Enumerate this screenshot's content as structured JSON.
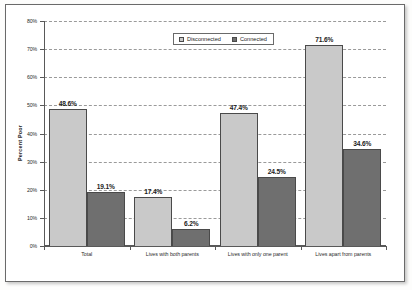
{
  "figure": {
    "frame_border_color": "#6a6a6a",
    "background": "#ffffff"
  },
  "legend": {
    "position": "top-center",
    "entries": [
      {
        "label": "Disconnected",
        "color": "#c9c9c9",
        "swatch_name": "legend-swatch-disconnected"
      },
      {
        "label": "Connected",
        "color": "#6f6f6f",
        "swatch_name": "legend-swatch-connected"
      }
    ]
  },
  "axes": {
    "ylabel": "Percent Poor",
    "yticks": [
      "80%",
      "70%",
      "60%",
      "50%",
      "40%",
      "30%",
      "20%",
      "10%",
      "0%"
    ],
    "ymin": 0,
    "ymax": 80
  },
  "chart_data": {
    "type": "bar",
    "title": "",
    "subtitle": "",
    "xlabel": "",
    "ylabel": "Percent Poor",
    "ylim": [
      0,
      80
    ],
    "ytick_values": [
      0,
      10,
      20,
      30,
      40,
      50,
      60,
      70,
      80
    ],
    "ytick_labels": [
      "0%",
      "10%",
      "20%",
      "30%",
      "40%",
      "50%",
      "60%",
      "70%",
      "80%"
    ],
    "grid": true,
    "grid_style": "dashed-horizontal",
    "legend_position": "top-center",
    "categories": [
      "Total",
      "Lives with both parents",
      "Lives with only one parent",
      "Lives apart from parents"
    ],
    "series": [
      {
        "name": "Disconnected",
        "color": "#c9c9c9",
        "values": [
          48.6,
          17.4,
          47.4,
          71.6
        ],
        "data_labels": [
          "48.6%",
          "17.4%",
          "47.4%",
          "71.6%"
        ]
      },
      {
        "name": "Connected",
        "color": "#6f6f6f",
        "values": [
          19.1,
          6.2,
          24.5,
          34.6
        ],
        "data_labels": [
          "19.1%",
          "6.2%",
          "24.5%",
          "34.6%"
        ]
      }
    ]
  }
}
